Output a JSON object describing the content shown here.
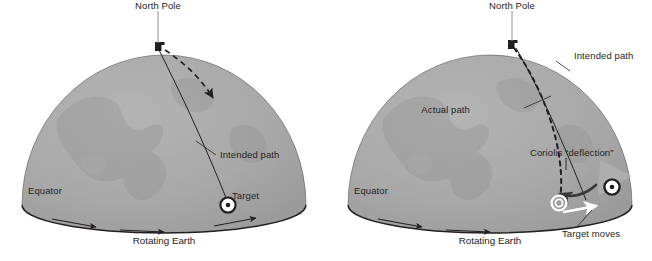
{
  "figure": {
    "panels": [
      {
        "id": "left-panel",
        "caption": "Rotating Earth",
        "labels": {
          "north_pole": "North Pole",
          "equator": "Equator",
          "intended_path": "Intended path",
          "target": "Target"
        },
        "markers": {
          "pole_marker": "pole-launch-marker",
          "target_marker": "bullseye-target"
        },
        "paths": {
          "intended": "solid-meridian-curve",
          "actual": "dashed-arrow-from-pole"
        }
      },
      {
        "id": "right-panel",
        "caption": "Rotating Earth",
        "labels": {
          "north_pole": "North Pole",
          "equator": "Equator",
          "intended_path": "Intended path",
          "actual_path": "Actual path",
          "coriolis": "Coriolis “deflection”",
          "target_moves": "Target moves"
        },
        "markers": {
          "pole_marker": "pole-launch-marker",
          "target_marker_original": "bullseye-target-original",
          "target_marker_moved": "ring-target-moved"
        },
        "paths": {
          "intended": "solid-meridian-curve",
          "actual": "dashed-deflected-curve",
          "deflection_arrow": "dark-leftward-arrow",
          "target_motion_arrow": "white-rightward-arrow"
        }
      }
    ],
    "colors": {
      "globe_fill": "#a8a8a8",
      "globe_shade": "#9c9c9c",
      "outline": "#231f20",
      "text": "#231f20",
      "white_arrow": "#ffffff",
      "background": "#ffffff"
    }
  }
}
